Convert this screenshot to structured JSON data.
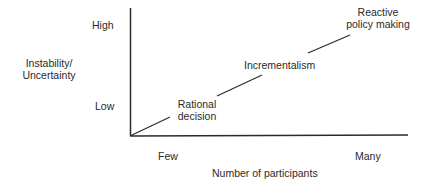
{
  "diagram": {
    "y_axis": {
      "label_line1": "Instability/",
      "label_line2": "Uncertainty",
      "high": "High",
      "low": "Low"
    },
    "x_axis": {
      "label": "Number of participants",
      "few": "Few",
      "many": "Many"
    },
    "stages": [
      {
        "line1": "Rational",
        "line2": "decision"
      },
      {
        "line1": "Incrementalism"
      },
      {
        "line1": "Reactive",
        "line2": "policy making"
      }
    ],
    "colors": {
      "ink": "#2a2a2a",
      "background": "#ffffff"
    }
  }
}
